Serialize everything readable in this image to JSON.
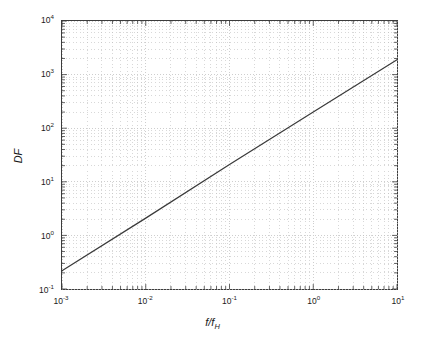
{
  "chart_data": {
    "type": "line",
    "title": "",
    "xlabel": "f/f_H",
    "ylabel": "DF",
    "xscale": "log",
    "yscale": "log",
    "xlim": [
      0.001,
      10
    ],
    "ylim": [
      0.1,
      10000
    ],
    "grid": true,
    "minor_grid": true,
    "legend": "none",
    "xtick_labels": [
      "10-3",
      "10-2",
      "10-1",
      "100",
      "101"
    ],
    "ytick_labels": [
      "10-1",
      "100",
      "101",
      "102",
      "103",
      "104"
    ],
    "series": [
      {
        "name": "DF",
        "color": "#3a3a3a",
        "x": [
          0.001,
          0.01,
          0.1,
          1,
          10
        ],
        "values": [
          0.22,
          2.1,
          21,
          200,
          1900
        ]
      }
    ],
    "annotation": "Straight line on log-log axes: DF is approximately proportional to f/f_H, DF = 200 x (f/f_H)"
  },
  "axes": {
    "y_ticks": [
      {
        "label_base": "10",
        "label_exp": "4",
        "value": 10000
      },
      {
        "label_base": "10",
        "label_exp": "3",
        "value": 1000
      },
      {
        "label_base": "10",
        "label_exp": "2",
        "value": 100
      },
      {
        "label_base": "10",
        "label_exp": "1",
        "value": 10
      },
      {
        "label_base": "10",
        "label_exp": "0",
        "value": 1
      },
      {
        "label_base": "10",
        "label_exp": "-1",
        "value": 0.1
      }
    ],
    "x_ticks": [
      {
        "label_base": "10",
        "label_exp": "-3",
        "value": 0.001
      },
      {
        "label_base": "10",
        "label_exp": "-2",
        "value": 0.01
      },
      {
        "label_base": "10",
        "label_exp": "-1",
        "value": 0.1
      },
      {
        "label_base": "10",
        "label_exp": "0",
        "value": 1
      },
      {
        "label_base": "10",
        "label_exp": "1",
        "value": 10
      }
    ],
    "y_title": "DF",
    "x_title_num": "f",
    "x_title_sep": "/",
    "x_title_den": "f",
    "x_title_den_sub": "H"
  },
  "style": {
    "line_color": "#3a3a3a",
    "grid_color": "#bdbdbd",
    "frame_color": "#3c3c3c",
    "background": "#ffffff",
    "text_color": "#1a1a1a"
  }
}
